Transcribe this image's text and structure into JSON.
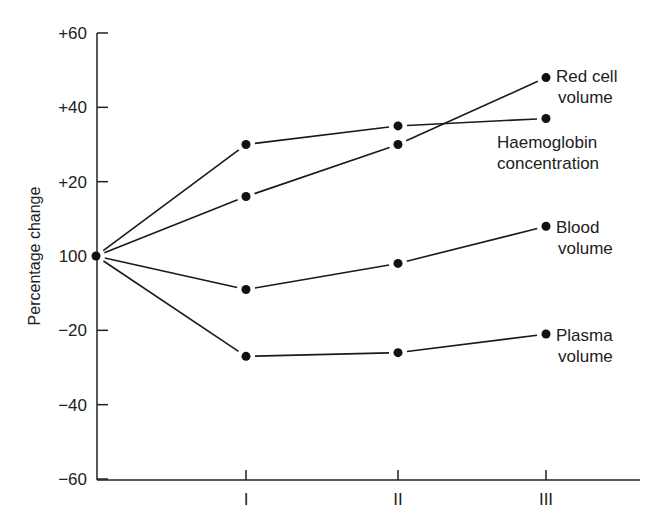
{
  "chart_data": {
    "type": "line",
    "title": "",
    "xlabel": "",
    "ylabel": "Percentage change",
    "x": [
      "0",
      "I",
      "II",
      "III"
    ],
    "x_tick_labels": [
      "I",
      "II",
      "III"
    ],
    "y_tick_labels": [
      "+60",
      "+40",
      "+20",
      "100",
      "-20",
      "-40",
      "-60"
    ],
    "y_tick_values": [
      60,
      40,
      20,
      0,
      -20,
      -40,
      -60
    ],
    "ylim": [
      -60,
      60
    ],
    "grid": false,
    "legend": "inline labels at right end of each line",
    "series": [
      {
        "name": "Red cell volume",
        "label_lines": [
          "Red cell",
          "volume"
        ],
        "values": [
          0,
          16,
          30,
          48
        ]
      },
      {
        "name": "Haemoglobin concentration",
        "label_lines": [
          "Haemoglobin",
          "concentration"
        ],
        "values": [
          0,
          30,
          35,
          37
        ]
      },
      {
        "name": "Blood volume",
        "label_lines": [
          "Blood",
          "volume"
        ],
        "values": [
          0,
          -9,
          -2,
          8
        ]
      },
      {
        "name": "Plasma volume",
        "label_lines": [
          "Plasma",
          "volume"
        ],
        "values": [
          0,
          -27,
          -26,
          -21
        ]
      }
    ]
  }
}
